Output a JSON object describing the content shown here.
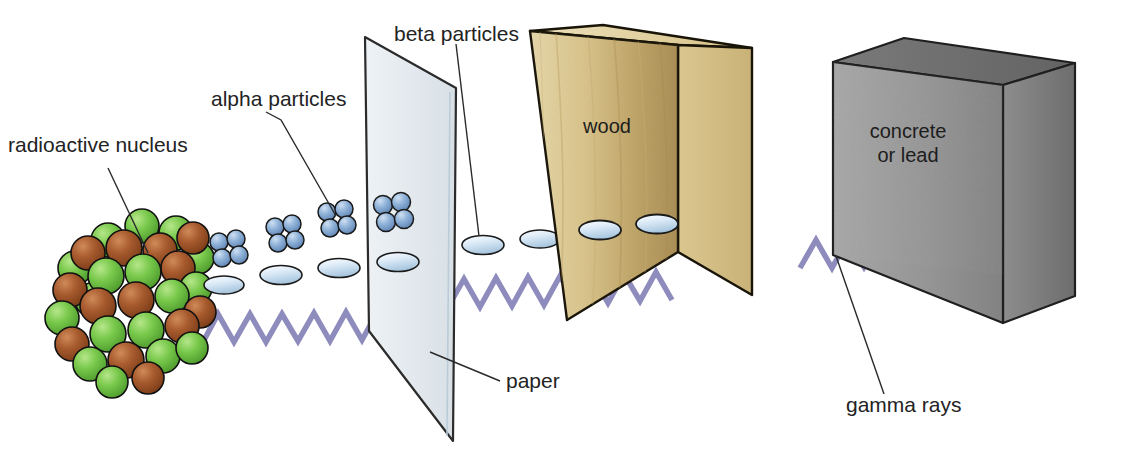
{
  "figure": {
    "background_color": "#ffffff"
  },
  "labels": {
    "radioactive_nucleus": "radioactive nucleus",
    "alpha_particles": "alpha particles",
    "beta_particles": "beta particles",
    "paper": "paper",
    "gamma_rays": "gamma rays"
  },
  "barriers": [
    {
      "id": "paper",
      "label": "paper",
      "label_on_face": "",
      "fill": "#e3e8ec",
      "edge": "#2b2b2b"
    },
    {
      "id": "wood",
      "label": "wood",
      "label_on_face": "wood",
      "fill": "#d9c48b",
      "side_fill": "#cdb87f",
      "top_fill": "#e4d3a4",
      "edge": "#1e1a12"
    },
    {
      "id": "concrete",
      "label": "concrete or lead",
      "label_on_face": [
        "concrete",
        "or lead"
      ],
      "fill": "#9a9a9a",
      "side_fill": "#7d7d7d",
      "top_fill": "#6e6e6e",
      "edge": "#1f1f1f"
    }
  ],
  "radiation": [
    {
      "name": "alpha particles",
      "glyph": "four-sphere-cluster",
      "color": "#7fa6d4",
      "stops_at": "paper",
      "count_drawn": 4
    },
    {
      "name": "beta particles",
      "glyph": "flat-ellipse",
      "color": "#cfe3f2",
      "stops_at": "wood",
      "count_drawn": 8
    },
    {
      "name": "gamma rays",
      "glyph": "zigzag-wave",
      "color": "#8e8bbd",
      "stops_at": "concrete or lead",
      "count_drawn": 1
    }
  ],
  "nucleus": {
    "name": "radioactive nucleus",
    "proton_color": "#a4552c",
    "neutron_color": "#79c council",
    "neutron_color_hex": "#77c34a",
    "sphere_count": 30
  }
}
